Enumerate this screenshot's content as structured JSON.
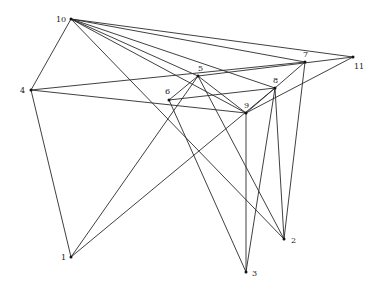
{
  "diagram": {
    "type": "graph",
    "title": "",
    "nodes": [
      {
        "id": "1",
        "label": "1",
        "x": 71,
        "y": 257,
        "lx": 61,
        "ly": 260
      },
      {
        "id": "2",
        "label": "2",
        "x": 284,
        "y": 239,
        "lx": 291,
        "ly": 243
      },
      {
        "id": "3",
        "label": "3",
        "x": 246,
        "y": 272,
        "lx": 252,
        "ly": 276
      },
      {
        "id": "4",
        "label": "4",
        "x": 31,
        "y": 90,
        "lx": 20,
        "ly": 93
      },
      {
        "id": "5",
        "label": "5",
        "x": 198,
        "y": 76,
        "lx": 198,
        "ly": 71
      },
      {
        "id": "6",
        "label": "6",
        "x": 169,
        "y": 100,
        "lx": 165,
        "ly": 94
      },
      {
        "id": "7",
        "label": "7",
        "x": 305,
        "y": 62,
        "lx": 303,
        "ly": 57
      },
      {
        "id": "8",
        "label": "8",
        "x": 275,
        "y": 88,
        "lx": 273,
        "ly": 83
      },
      {
        "id": "9",
        "label": "9",
        "x": 246,
        "y": 113,
        "lx": 244,
        "ly": 108
      },
      {
        "id": "10",
        "label": "10",
        "x": 71,
        "y": 19,
        "lx": 56,
        "ly": 22
      },
      {
        "id": "11",
        "label": "11",
        "x": 353,
        "y": 57,
        "lx": 354,
        "ly": 69
      }
    ],
    "edges": [
      [
        "10",
        "4"
      ],
      [
        "10",
        "11"
      ],
      [
        "10",
        "7"
      ],
      [
        "10",
        "8"
      ],
      [
        "10",
        "9"
      ],
      [
        "10",
        "2"
      ],
      [
        "10",
        "5"
      ],
      [
        "4",
        "1"
      ],
      [
        "4",
        "7"
      ],
      [
        "4",
        "9"
      ],
      [
        "1",
        "5"
      ],
      [
        "1",
        "8"
      ],
      [
        "6",
        "5"
      ],
      [
        "6",
        "3"
      ],
      [
        "6",
        "8"
      ],
      [
        "5",
        "11"
      ],
      [
        "5",
        "2"
      ],
      [
        "5",
        "9"
      ],
      [
        "9",
        "8"
      ],
      [
        "9",
        "3"
      ],
      [
        "9",
        "11"
      ],
      [
        "8",
        "7"
      ],
      [
        "8",
        "3"
      ],
      [
        "8",
        "2"
      ],
      [
        "7",
        "2"
      ]
    ],
    "colors": {
      "edge": "#2a2a2a",
      "node": "#111111",
      "label": "#222222",
      "background": "#ffffff"
    }
  }
}
